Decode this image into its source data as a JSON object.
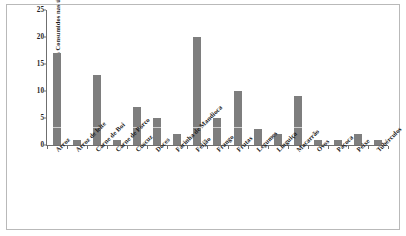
{
  "chart_data": {
    "type": "bar",
    "title": "",
    "xlabel": "",
    "ylabel": "Alimentos Consumidos nas últimas 24h (%)",
    "ylim": [
      0,
      25
    ],
    "yticks": [
      0,
      5,
      10,
      15,
      20,
      25
    ],
    "grid": false,
    "legend": "none",
    "bar_color": "#7e7e7e",
    "categories": [
      "Arroz",
      "Arroz de leite",
      "Carne de Boi",
      "Carne de Porco",
      "Cuscuz",
      "Doces",
      "Farinha de Mandioca",
      "Feijão",
      "Frango",
      "Frutas",
      "Legumes",
      "Linguiça",
      "Macarrão",
      "Ovos",
      "Paçoca",
      "Peixe",
      "Tubérculos"
    ],
    "values": [
      17,
      1,
      13,
      1,
      7,
      5,
      2,
      20,
      5,
      10,
      3,
      2,
      9,
      1,
      1,
      2,
      1
    ]
  }
}
